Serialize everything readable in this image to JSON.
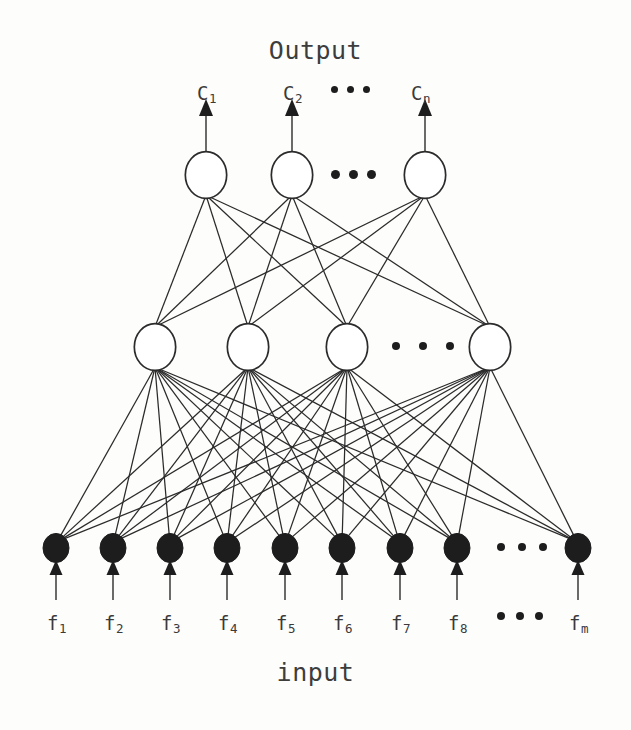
{
  "figure": {
    "type": "neural-network-architecture-diagram",
    "top_title": "Output",
    "bottom_title": "input",
    "background_color": "#fdfdfc",
    "stroke_color": "#2b2b2b",
    "node_fill_hollow": "#ffffff",
    "node_fill_solid": "#1d1d1d"
  },
  "chart_data": {
    "type": "diagram",
    "title": "Output",
    "xlabel": "input",
    "ylabel": "",
    "layers": [
      {
        "name": "output-layer",
        "style": "hollow-circle",
        "visible_nodes": 3,
        "truncated": true,
        "ellipsis_after_index": 2,
        "labels": [
          "C1",
          "C2",
          "Cn"
        ],
        "label_bases": [
          "C",
          "C",
          "C"
        ],
        "label_subs": [
          "1",
          "2",
          "n"
        ]
      },
      {
        "name": "hidden-layer",
        "style": "hollow-circle",
        "visible_nodes": 4,
        "truncated": true,
        "ellipsis_after_index": 3,
        "labels": []
      },
      {
        "name": "input-layer",
        "style": "filled-circle",
        "visible_nodes": 9,
        "truncated": true,
        "ellipsis_after_index": 8,
        "labels": [
          "f1",
          "f2",
          "f3",
          "f4",
          "f5",
          "f6",
          "f7",
          "f8",
          "fm"
        ],
        "label_bases": [
          "f",
          "f",
          "f",
          "f",
          "f",
          "f",
          "f",
          "f",
          "f"
        ],
        "label_subs": [
          "1",
          "2",
          "3",
          "4",
          "5",
          "6",
          "7",
          "8",
          "m"
        ]
      }
    ],
    "connections": [
      {
        "from": "input-layer",
        "to": "hidden-layer",
        "pattern": "fully-connected"
      },
      {
        "from": "hidden-layer",
        "to": "output-layer",
        "pattern": "fully-connected"
      }
    ],
    "arrows": {
      "input_arrows": {
        "count": 9,
        "direction": "up",
        "into": "input-layer"
      },
      "output_arrows": {
        "count": 3,
        "direction": "up",
        "out_of": "output-layer"
      }
    },
    "ellipsis_glyph": "•••"
  },
  "geometry": {
    "output_nodes_x": [
      206,
      292,
      425
    ],
    "output_nodes_y": 175,
    "output_radius": 22,
    "hidden_nodes_x": [
      155,
      248,
      347,
      490
    ],
    "hidden_nodes_y": 347,
    "hidden_radius": 22,
    "input_nodes_x": [
      56,
      113,
      170,
      227,
      285,
      342,
      400,
      457,
      578
    ],
    "input_nodes_y": 548,
    "input_radius": 13
  },
  "labels": {
    "output_title": "Output",
    "input_title": "input",
    "output_nodes": [
      {
        "base": "C",
        "sub": "1",
        "x": 197,
        "y": 84
      },
      {
        "base": "C",
        "sub": "2",
        "x": 283,
        "y": 84
      },
      {
        "base": "C",
        "sub": "n",
        "x": 411,
        "y": 84
      }
    ],
    "input_nodes": [
      {
        "base": "f",
        "sub": "1",
        "x": 47,
        "y": 614
      },
      {
        "base": "f",
        "sub": "2",
        "x": 104,
        "y": 614
      },
      {
        "base": "f",
        "sub": "3",
        "x": 161,
        "y": 614
      },
      {
        "base": "f",
        "sub": "4",
        "x": 218,
        "y": 614
      },
      {
        "base": "f",
        "sub": "5",
        "x": 276,
        "y": 614
      },
      {
        "base": "f",
        "sub": "6",
        "x": 333,
        "y": 614
      },
      {
        "base": "f",
        "sub": "7",
        "x": 391,
        "y": 614
      },
      {
        "base": "f",
        "sub": "8",
        "x": 448,
        "y": 614
      },
      {
        "base": "f",
        "sub": "m",
        "x": 569,
        "y": 614
      }
    ]
  }
}
